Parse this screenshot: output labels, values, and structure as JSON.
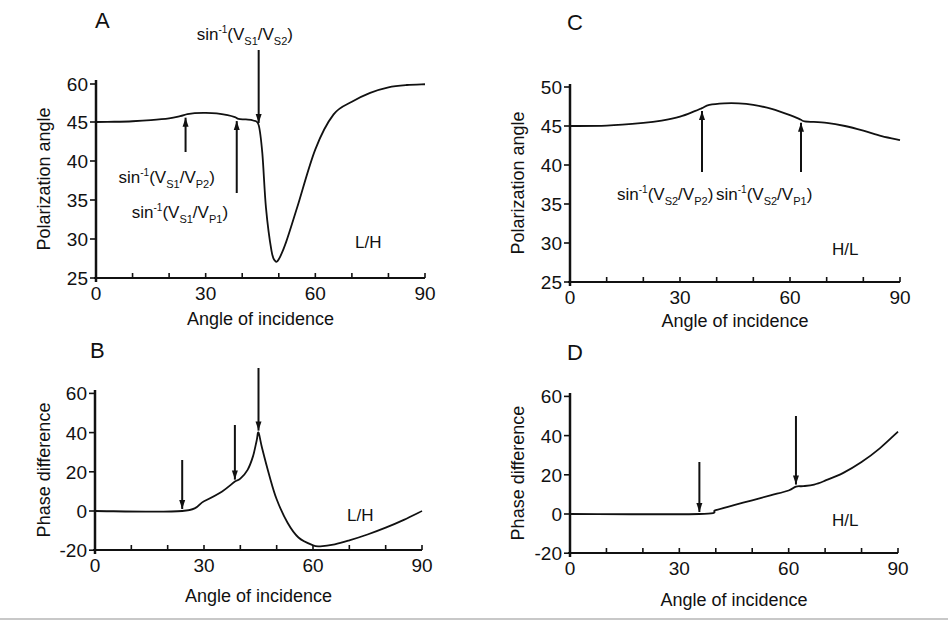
{
  "chart_data": [
    {
      "panel": "A",
      "type": "line",
      "xlabel": "Angle of incidence",
      "ylabel": "Polarization angle",
      "xticks": [
        0,
        30,
        60,
        90
      ],
      "yticks": [
        "25",
        "30",
        "35",
        "40",
        "45",
        "60"
      ],
      "xlim": [
        0,
        90
      ],
      "ylim_pixel_map": {
        "25": 278,
        "30": 239,
        "35": 200,
        "40": 161,
        "45": 122,
        "60": 84
      },
      "case_label": "L/H",
      "x": [
        0,
        5,
        10,
        15,
        20,
        23,
        25,
        27,
        30,
        33,
        36,
        38,
        39,
        41,
        43,
        44.5,
        45.5,
        46.5,
        48,
        49,
        50,
        52,
        55,
        60,
        65,
        70,
        75,
        80,
        85,
        90
      ],
      "y": [
        45,
        45.1,
        45.3,
        45.7,
        46.4,
        47.3,
        48.1,
        48.5,
        48.6,
        48.4,
        47.7,
        46.9,
        46.2,
        46.0,
        45.6,
        44.6,
        41,
        34,
        28.5,
        27.2,
        27.4,
        29.6,
        34,
        41.5,
        48,
        53,
        56.5,
        58.7,
        59.6,
        59.9
      ],
      "annotations": [
        {
          "text_main": "sin",
          "sup": "-1",
          "open": "(V",
          "sub1": "S1",
          "slash": "/V",
          "sub2": "S2",
          "close": ")",
          "x": 44.5,
          "arrow": "down"
        },
        {
          "text_main": "sin",
          "sup": "-1",
          "open": "(V",
          "sub1": "S1",
          "slash": "/V",
          "sub2": "P2",
          "close": ")",
          "x": 24.5,
          "arrow": "up"
        },
        {
          "text_main": "sin",
          "sup": "-1",
          "open": "(V",
          "sub1": "S1",
          "slash": "/V",
          "sub2": "P1",
          "close": ")",
          "x": 38.5,
          "arrow": "up"
        }
      ]
    },
    {
      "panel": "B",
      "type": "line",
      "xlabel": "Angle of incidence",
      "ylabel": "Phase difference",
      "xticks": [
        0,
        30,
        60,
        90
      ],
      "yticks": [
        -20,
        0,
        20,
        40,
        60
      ],
      "xlim": [
        0,
        90
      ],
      "ylim": [
        -20,
        60
      ],
      "case_label": "L/H",
      "x": [
        0,
        24,
        30,
        35,
        38.5,
        40,
        42,
        43.5,
        44.5,
        45,
        46,
        48,
        50,
        53,
        56,
        60,
        62,
        66,
        70,
        75,
        80,
        85,
        90
      ],
      "y": [
        0,
        0,
        5,
        10,
        15,
        16.5,
        21,
        28,
        36,
        40,
        32,
        18,
        6,
        -6,
        -13.5,
        -17.5,
        -18,
        -17,
        -15,
        -12,
        -8.5,
        -4.5,
        0
      ],
      "arrows_x": [
        24,
        38.5,
        45
      ]
    },
    {
      "panel": "C",
      "type": "line",
      "xlabel": "Angle of incidence",
      "ylabel": "Polarization angle",
      "xticks": [
        0,
        30,
        60,
        90
      ],
      "yticks": [
        25,
        30,
        35,
        40,
        45,
        50
      ],
      "xlim": [
        0,
        90
      ],
      "ylim": [
        25,
        50
      ],
      "case_label": "H/L",
      "x": [
        0,
        10,
        20,
        25,
        30,
        34,
        36,
        38,
        42,
        46,
        50,
        55,
        60,
        63,
        64,
        70,
        75,
        80,
        85,
        90
      ],
      "y": [
        45,
        45.05,
        45.4,
        45.7,
        46.2,
        46.9,
        47.3,
        47.7,
        47.9,
        47.9,
        47.7,
        47.2,
        46.4,
        45.8,
        45.6,
        45.4,
        45.0,
        44.4,
        43.7,
        43.2
      ],
      "annotations": [
        {
          "text_main": "sin",
          "sup": "-1",
          "open": "(V",
          "sub1": "S2",
          "slash": "/V",
          "sub2": "P2",
          "close": ")",
          "x": 36,
          "arrow": "up"
        },
        {
          "text_main": "sin",
          "sup": "-1",
          "open": "(V",
          "sub1": "S2",
          "slash": "/V",
          "sub2": "P1",
          "close": ")",
          "x": 63,
          "arrow": "up"
        }
      ]
    },
    {
      "panel": "D",
      "type": "line",
      "xlabel": "Angle of incidence",
      "ylabel": "Phase difference",
      "xticks": [
        0,
        30,
        60,
        90
      ],
      "yticks": [
        -20,
        0,
        20,
        40,
        60
      ],
      "xlim": [
        0,
        90
      ],
      "ylim": [
        -20,
        60
      ],
      "case_label": "H/L",
      "x": [
        0,
        35.5,
        40,
        45,
        50,
        55,
        60,
        62,
        64,
        67,
        70,
        75,
        80,
        85,
        90
      ],
      "y": [
        0,
        0,
        2,
        4.5,
        7,
        9.5,
        12,
        14,
        14.2,
        15,
        17,
        21,
        26.5,
        33.5,
        42
      ],
      "arrows_x": [
        35.5,
        62
      ]
    }
  ],
  "panels": {
    "A": {
      "letter": "A",
      "xlabel": "Angle of incidence",
      "ylabel": "Polarization angle",
      "case": "L/H"
    },
    "B": {
      "letter": "B",
      "xlabel": "Angle of incidence",
      "ylabel": "Phase difference",
      "case": "L/H"
    },
    "C": {
      "letter": "C",
      "xlabel": "Angle of incidence",
      "ylabel": "Polarization angle",
      "case": "H/L"
    },
    "D": {
      "letter": "D",
      "xlabel": "Angle of incidence",
      "ylabel": "Phase difference",
      "case": "H/L"
    }
  },
  "colors": {
    "ink": "#111111",
    "background": "#ffffff",
    "rule": "#c8c8c8"
  }
}
